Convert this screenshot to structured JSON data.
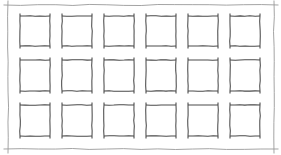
{
  "canvas": {
    "width": 281,
    "height": 155,
    "background_color": "#ffffff",
    "title": "Wireframe grid sketch"
  },
  "frame": {
    "name": "outer-frame",
    "stroke_color": "#9a9a9a",
    "stroke_width": 0.9,
    "left": 8,
    "top": 5,
    "right": 274,
    "bottom": 149,
    "overshoot": 4,
    "style": "hand-drawn"
  },
  "grid": {
    "columns": 6,
    "rows": 3,
    "total_boxes": 18,
    "box_width": 30,
    "box_height": 30,
    "column_x": [
      20,
      62,
      104,
      146,
      188,
      230
    ],
    "row_y": [
      16,
      60,
      105
    ],
    "column_pitch": 42,
    "row_pitch": 44.5,
    "stroke_color": "#4a4a4a",
    "stroke_width": 1.05,
    "corner_tick_length": 2.5
  },
  "boxes": [
    {
      "id": "box-r1c1",
      "label": "",
      "row": 1,
      "col": 1,
      "x": 20,
      "y": 16,
      "w": 30,
      "h": 30
    },
    {
      "id": "box-r1c2",
      "label": "",
      "row": 1,
      "col": 2,
      "x": 62,
      "y": 16,
      "w": 30,
      "h": 30
    },
    {
      "id": "box-r1c3",
      "label": "",
      "row": 1,
      "col": 3,
      "x": 104,
      "y": 16,
      "w": 30,
      "h": 30
    },
    {
      "id": "box-r1c4",
      "label": "",
      "row": 1,
      "col": 4,
      "x": 146,
      "y": 16,
      "w": 30,
      "h": 30
    },
    {
      "id": "box-r1c5",
      "label": "",
      "row": 1,
      "col": 5,
      "x": 188,
      "y": 16,
      "w": 30,
      "h": 30
    },
    {
      "id": "box-r1c6",
      "label": "",
      "row": 1,
      "col": 6,
      "x": 230,
      "y": 16,
      "w": 30,
      "h": 30
    },
    {
      "id": "box-r2c1",
      "label": "",
      "row": 2,
      "col": 1,
      "x": 20,
      "y": 60,
      "w": 30,
      "h": 31
    },
    {
      "id": "box-r2c2",
      "label": "",
      "row": 2,
      "col": 2,
      "x": 62,
      "y": 60,
      "w": 30,
      "h": 31
    },
    {
      "id": "box-r2c3",
      "label": "",
      "row": 2,
      "col": 3,
      "x": 104,
      "y": 60,
      "w": 30,
      "h": 31
    },
    {
      "id": "box-r2c4",
      "label": "",
      "row": 2,
      "col": 4,
      "x": 146,
      "y": 60,
      "w": 30,
      "h": 31
    },
    {
      "id": "box-r2c5",
      "label": "",
      "row": 2,
      "col": 5,
      "x": 188,
      "y": 60,
      "w": 30,
      "h": 31
    },
    {
      "id": "box-r2c6",
      "label": "",
      "row": 2,
      "col": 6,
      "x": 230,
      "y": 60,
      "w": 30,
      "h": 31
    },
    {
      "id": "box-r3c1",
      "label": "",
      "row": 3,
      "col": 1,
      "x": 20,
      "y": 105,
      "w": 30,
      "h": 31
    },
    {
      "id": "box-r3c2",
      "label": "",
      "row": 3,
      "col": 2,
      "x": 62,
      "y": 105,
      "w": 30,
      "h": 31
    },
    {
      "id": "box-r3c3",
      "label": "",
      "row": 3,
      "col": 3,
      "x": 104,
      "y": 105,
      "w": 30,
      "h": 31
    },
    {
      "id": "box-r3c4",
      "label": "",
      "row": 3,
      "col": 4,
      "x": 146,
      "y": 105,
      "w": 30,
      "h": 31
    },
    {
      "id": "box-r3c5",
      "label": "",
      "row": 3,
      "col": 5,
      "x": 188,
      "y": 105,
      "w": 30,
      "h": 31
    },
    {
      "id": "box-r3c6",
      "label": "",
      "row": 3,
      "col": 6,
      "x": 230,
      "y": 105,
      "w": 30,
      "h": 31
    }
  ]
}
